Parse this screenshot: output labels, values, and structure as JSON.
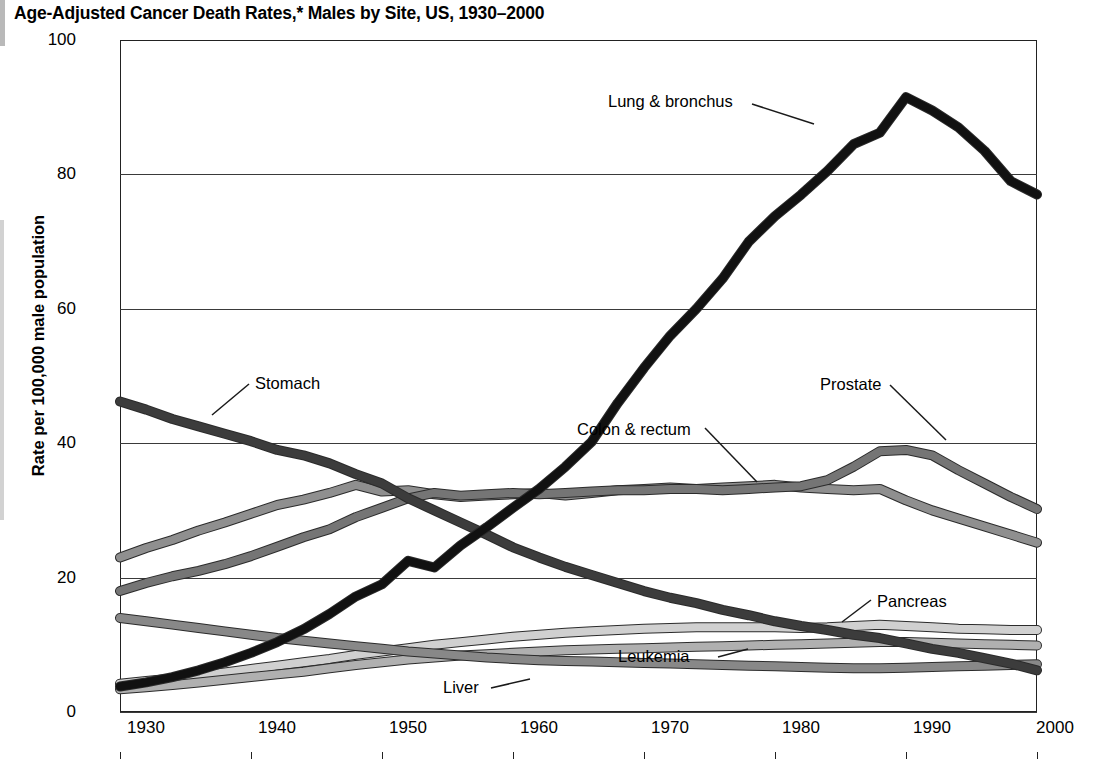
{
  "chart_data": {
    "type": "line",
    "title": "Age-Adjusted Cancer Death Rates,* Males by Site, US, 1930–2000",
    "xlabel": "",
    "ylabel": "Rate per 100,000 male population",
    "xlim": [
      1930,
      2000
    ],
    "ylim": [
      0,
      100
    ],
    "grid": true,
    "legend_position": "inline-annotations",
    "xticks": [
      "1930",
      "1940",
      "1950",
      "1960",
      "1970",
      "1980",
      "1990",
      "2000"
    ],
    "yticks": [
      "0",
      "20",
      "40",
      "60",
      "80",
      "100"
    ],
    "footnote_marker": "*",
    "x": [
      1930,
      1932,
      1934,
      1936,
      1938,
      1940,
      1942,
      1944,
      1946,
      1948,
      1950,
      1952,
      1954,
      1956,
      1958,
      1960,
      1962,
      1964,
      1966,
      1968,
      1970,
      1972,
      1974,
      1976,
      1978,
      1980,
      1982,
      1984,
      1986,
      1988,
      1990,
      1992,
      1994,
      1996,
      1998,
      2000
    ],
    "series": [
      {
        "name": "Lung & bronchus",
        "color": "#111111",
        "label": "Lung & bronchus",
        "values": [
          3.8,
          4.4,
          5.2,
          6.2,
          7.4,
          8.8,
          10.4,
          12.3,
          14.6,
          17.2,
          19.0,
          22.5,
          21.5,
          24.8,
          27.5,
          30.4,
          33.2,
          36.5,
          40.2,
          46.0,
          51.2,
          56.0,
          60.0,
          64.5,
          70.0,
          73.8,
          77.0,
          80.5,
          84.5,
          86.2,
          91.5,
          89.5,
          87.0,
          83.5,
          79.0,
          77.0
        ]
      },
      {
        "name": "Stomach",
        "color": "#3c3c3c",
        "label": "Stomach",
        "values": [
          46.2,
          45.0,
          43.6,
          42.5,
          41.4,
          40.3,
          39.0,
          38.2,
          37.0,
          35.4,
          34.0,
          31.8,
          30.0,
          28.2,
          26.4,
          24.5,
          23.0,
          21.6,
          20.4,
          19.2,
          18.0,
          17.0,
          16.2,
          15.2,
          14.4,
          13.5,
          12.8,
          12.2,
          11.5,
          11.0,
          10.2,
          9.4,
          8.8,
          8.0,
          7.2,
          6.2
        ]
      },
      {
        "name": "Prostate",
        "color": "#757575",
        "label": "Prostate",
        "values": [
          18.0,
          19.2,
          20.2,
          21.0,
          22.0,
          23.2,
          24.6,
          26.0,
          27.2,
          29.0,
          30.4,
          31.8,
          32.6,
          32.2,
          32.4,
          32.6,
          32.4,
          32.6,
          32.8,
          33.0,
          33.0,
          33.2,
          33.2,
          33.0,
          33.2,
          33.4,
          33.6,
          34.5,
          36.5,
          38.8,
          39.0,
          38.2,
          36.0,
          34.0,
          32.0,
          30.2
        ]
      },
      {
        "name": "Colon & rectum",
        "color": "#8f8f8f",
        "label": "Colon & rectum",
        "values": [
          23.0,
          24.4,
          25.6,
          27.0,
          28.2,
          29.5,
          30.8,
          31.6,
          32.6,
          33.8,
          32.8,
          33.0,
          32.4,
          32.0,
          32.2,
          32.4,
          32.6,
          32.2,
          32.6,
          33.0,
          33.2,
          33.4,
          33.2,
          33.4,
          33.6,
          33.8,
          33.4,
          33.2,
          33.0,
          33.2,
          31.5,
          30.0,
          28.8,
          27.6,
          26.4,
          25.2
        ]
      },
      {
        "name": "Liver",
        "color": "#888888",
        "label": "Liver",
        "values": [
          14.0,
          13.5,
          13.0,
          12.5,
          12.0,
          11.5,
          11.0,
          10.6,
          10.2,
          9.8,
          9.4,
          9.0,
          8.7,
          8.4,
          8.1,
          7.9,
          7.7,
          7.6,
          7.5,
          7.4,
          7.3,
          7.2,
          7.1,
          7.0,
          6.9,
          6.8,
          6.7,
          6.6,
          6.5,
          6.5,
          6.6,
          6.7,
          6.8,
          6.9,
          7.0,
          7.1
        ]
      },
      {
        "name": "Pancreas",
        "color": "#d0d0d0",
        "label": "Pancreas",
        "values": [
          4.2,
          4.6,
          5.0,
          5.4,
          5.9,
          6.4,
          6.9,
          7.4,
          7.9,
          8.5,
          9.0,
          9.5,
          10.0,
          10.4,
          10.8,
          11.2,
          11.5,
          11.8,
          12.0,
          12.2,
          12.4,
          12.5,
          12.6,
          12.6,
          12.6,
          12.6,
          12.5,
          12.6,
          12.8,
          13.0,
          12.8,
          12.6,
          12.4,
          12.3,
          12.2,
          12.2
        ]
      },
      {
        "name": "Leukemia",
        "color": "#b0b0b0",
        "label": "Leukemia",
        "values": [
          3.4,
          3.7,
          4.0,
          4.4,
          4.8,
          5.2,
          5.6,
          6.0,
          6.5,
          7.0,
          7.4,
          7.8,
          8.1,
          8.4,
          8.6,
          8.8,
          9.0,
          9.2,
          9.3,
          9.4,
          9.5,
          9.6,
          9.7,
          9.8,
          9.9,
          10.0,
          10.1,
          10.2,
          10.3,
          10.4,
          10.4,
          10.3,
          10.2,
          10.1,
          10.0,
          9.9
        ]
      }
    ],
    "annotations": [
      {
        "text": "Lung & bronchus",
        "x_px": 608,
        "y_px": 92
      },
      {
        "text": "Stomach",
        "x_px": 255,
        "y_px": 374
      },
      {
        "text": "Colon & rectum",
        "x_px": 577,
        "y_px": 420
      },
      {
        "text": "Prostate",
        "x_px": 820,
        "y_px": 375
      },
      {
        "text": "Pancreas",
        "x_px": 877,
        "y_px": 592
      },
      {
        "text": "Leukemia",
        "x_px": 618,
        "y_px": 647
      },
      {
        "text": "Liver",
        "x_px": 443,
        "y_px": 678
      }
    ]
  }
}
